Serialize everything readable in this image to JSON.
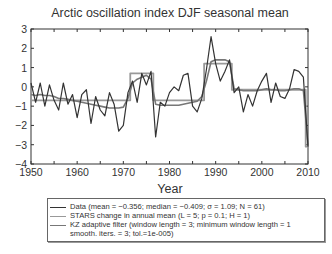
{
  "chart_data": {
    "type": "line",
    "title": "Arctic oscillation index DJF seasonal mean",
    "xlabel": "Year",
    "ylabel": "",
    "xlim": [
      1950,
      2010
    ],
    "ylim": [
      -4,
      3
    ],
    "xticks": [
      1950,
      1960,
      1970,
      1980,
      1990,
      2000,
      2010
    ],
    "yticks": [
      3,
      2,
      1,
      0,
      -1,
      -2,
      -3,
      -4
    ],
    "grid": false,
    "legend_position": "below",
    "x": [
      1950,
      1951,
      1952,
      1953,
      1954,
      1955,
      1956,
      1957,
      1958,
      1959,
      1960,
      1961,
      1962,
      1963,
      1964,
      1965,
      1966,
      1967,
      1968,
      1969,
      1970,
      1971,
      1972,
      1973,
      1974,
      1975,
      1976,
      1977,
      1978,
      1979,
      1980,
      1981,
      1982,
      1983,
      1984,
      1985,
      1986,
      1987,
      1988,
      1989,
      1990,
      1991,
      1992,
      1993,
      1994,
      1995,
      1996,
      1997,
      1998,
      1999,
      2000,
      2001,
      2002,
      2003,
      2004,
      2005,
      2006,
      2007,
      2008,
      2009,
      2010
    ],
    "series": [
      {
        "name": "Data (mean = −0.356; median = −0.409; σ = 1.09; N = 61)",
        "color": "#333333",
        "values": [
          0.2,
          -0.8,
          0.2,
          -1.0,
          0.1,
          -0.7,
          -1.2,
          0.2,
          -0.9,
          -0.4,
          -1.6,
          -0.4,
          -0.15,
          -1.9,
          -0.5,
          -1.2,
          -1.5,
          -0.3,
          -0.9,
          -2.3,
          -2.0,
          -0.3,
          0.3,
          -0.8,
          0.7,
          0.1,
          0.8,
          -2.6,
          -0.8,
          -1.0,
          -0.3,
          0.0,
          -0.2,
          0.6,
          0.7,
          -1.0,
          -1.3,
          -0.6,
          0.9,
          2.6,
          1.2,
          0.3,
          0.8,
          1.4,
          -0.3,
          0.0,
          -1.3,
          -0.4,
          -1.0,
          -0.2,
          0.3,
          0.7,
          -0.8,
          0.2,
          -0.5,
          -0.6,
          -0.1,
          0.9,
          0.8,
          0.5,
          -3.1
        ]
      },
      {
        "name": "STARS change in annual mean (L = 5; p = 0.1; H = 1)",
        "color": "#999999",
        "values": [
          -0.7,
          -0.7,
          -0.7,
          -0.7,
          -0.7,
          -0.7,
          -0.7,
          -0.7,
          -0.7,
          -0.7,
          -0.7,
          -0.7,
          -0.7,
          -0.7,
          -0.7,
          -0.7,
          -0.7,
          -0.7,
          -0.7,
          -0.7,
          -0.7,
          -0.7,
          0.7,
          0.7,
          0.7,
          0.7,
          0.7,
          -0.7,
          -0.7,
          -0.7,
          -0.7,
          -0.7,
          -0.7,
          -0.7,
          -0.7,
          -0.7,
          -0.7,
          -0.7,
          1.2,
          1.2,
          1.2,
          1.2,
          1.2,
          1.2,
          -0.15,
          -0.15,
          -0.15,
          -0.15,
          -0.15,
          -0.15,
          -0.15,
          -0.15,
          -0.15,
          -0.15,
          -0.15,
          -0.15,
          -0.15,
          -0.15,
          -0.15,
          -0.15,
          -3.1
        ]
      },
      {
        "name": "KZ adaptive filter (window length = 3; minimum window length = 1 smooth. iters. = 3; tol.=1e-005)",
        "color": "#777777",
        "values": [
          -0.4,
          -0.45,
          -0.4,
          -0.45,
          -0.45,
          -0.5,
          -0.6,
          -0.6,
          -0.65,
          -0.7,
          -0.75,
          -0.8,
          -0.85,
          -0.9,
          -0.95,
          -1.0,
          -1.05,
          -1.1,
          -1.1,
          -1.1,
          -1.05,
          -0.6,
          0.2,
          0.4,
          0.5,
          0.6,
          0.4,
          -0.9,
          -0.95,
          -0.95,
          -0.95,
          -0.95,
          -0.95,
          -0.9,
          -0.85,
          -0.8,
          -0.75,
          -0.5,
          0.3,
          1.3,
          1.4,
          1.4,
          1.4,
          1.3,
          -0.1,
          -0.15,
          -0.2,
          -0.2,
          -0.2,
          -0.2,
          -0.15,
          -0.1,
          -0.15,
          -0.15,
          -0.2,
          -0.2,
          -0.15,
          -0.1,
          -0.1,
          -0.2,
          -3.0
        ]
      }
    ]
  },
  "legend": {
    "row1": "Data (mean = −0.356; median = −0.409; σ = 1.09; N = 61)",
    "row2": "STARS change in annual mean (L = 5; p = 0.1; H = 1)",
    "row3": "KZ adaptive filter (window length = 3; minimum window length = 1",
    "row4": "smooth. iters. = 3; tol.=1e-005)"
  }
}
